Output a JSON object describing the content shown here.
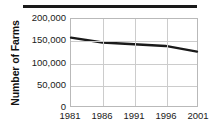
{
  "chart_data": {
    "type": "line",
    "title": "",
    "xlabel": "",
    "ylabel": "Number of Farms",
    "x": [
      1981,
      1986,
      1991,
      1996,
      2001
    ],
    "categories": [
      "1981",
      "1986",
      "1991",
      "1996",
      "2001"
    ],
    "values": [
      157000,
      146000,
      142000,
      138000,
      125000
    ],
    "series": [
      {
        "name": "Number of Farms",
        "values": [
          157000,
          146000,
          142000,
          138000,
          125000
        ]
      }
    ],
    "xlim": [
      1981,
      2001
    ],
    "ylim": [
      0,
      200000
    ],
    "ytick_labels": [
      "0",
      "50,000",
      "100,000",
      "150,000",
      "200,000"
    ],
    "ytick_values": [
      0,
      50000,
      100000,
      150000,
      200000
    ],
    "xtick_labels": [
      "1981",
      "1986",
      "1991",
      "1996",
      "2001"
    ],
    "grid": true,
    "legend": "none",
    "line_color": "#1a1a1a",
    "grid_color": "#cccccc",
    "frame_color": "#b9b9b9",
    "rule_color": "#1a1a1a"
  }
}
